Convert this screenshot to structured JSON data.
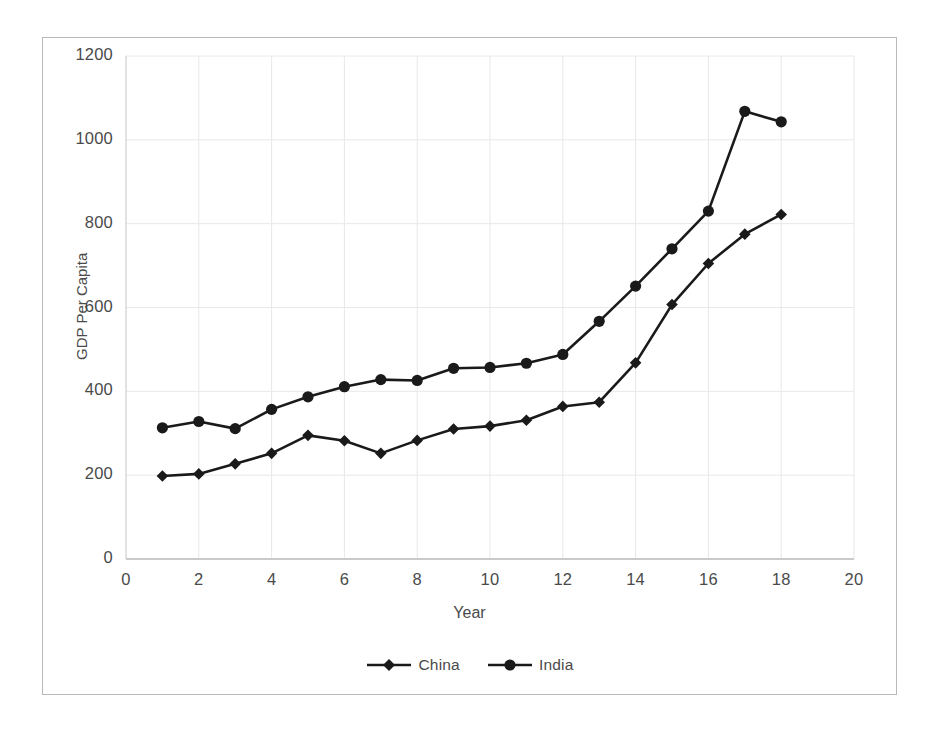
{
  "chart_data": {
    "type": "line",
    "title": "",
    "xlabel": "Year",
    "ylabel": "GDP Per Capita",
    "xlim": [
      0,
      20
    ],
    "ylim": [
      0,
      1200
    ],
    "x_ticks": [
      0,
      2,
      4,
      6,
      8,
      10,
      12,
      14,
      16,
      18,
      20
    ],
    "y_ticks": [
      0,
      200,
      400,
      600,
      800,
      1000,
      1200
    ],
    "grid": true,
    "legend_position": "bottom",
    "x": [
      1,
      2,
      3,
      4,
      5,
      6,
      7,
      8,
      9,
      10,
      11,
      12,
      13,
      14,
      15,
      16,
      17,
      18
    ],
    "series": [
      {
        "name": "China",
        "marker": "diamond",
        "color": "#1a1a1a",
        "values": [
          198,
          203,
          227,
          252,
          295,
          282,
          252,
          283,
          310,
          317,
          331,
          364,
          374,
          468,
          607,
          705,
          775,
          822
        ]
      },
      {
        "name": "India",
        "marker": "circle",
        "color": "#1a1a1a",
        "values": [
          313,
          328,
          311,
          357,
          387,
          411,
          428,
          426,
          455,
          457,
          467,
          488,
          567,
          651,
          740,
          830,
          1068,
          1043
        ]
      }
    ]
  },
  "axis": {
    "x_tick_labels": [
      "0",
      "2",
      "4",
      "6",
      "8",
      "10",
      "12",
      "14",
      "16",
      "18",
      "20"
    ],
    "y_tick_labels": [
      "0",
      "200",
      "400",
      "600",
      "800",
      "1000",
      "1200"
    ],
    "x_title": "Year",
    "y_title": "GDP Per Capita"
  },
  "legend": {
    "items": [
      {
        "label": "China",
        "marker": "diamond-marker-icon"
      },
      {
        "label": "India",
        "marker": "circle-marker-icon"
      }
    ]
  },
  "style": {
    "frame_color": "#b9b9b9",
    "grid_color": "#e8e8e8",
    "series_color": "#1a1a1a",
    "text_color": "#4a4a4a",
    "background": "#ffffff"
  }
}
